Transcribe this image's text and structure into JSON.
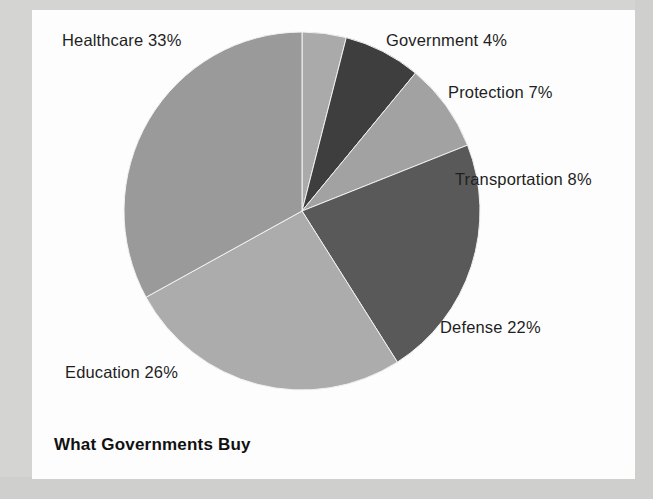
{
  "chart_data": {
    "type": "pie",
    "title": "What Governments Buy",
    "xlabel": "",
    "ylabel": "",
    "legend_position": "none",
    "grid": false,
    "value_unit": "%",
    "categories": [
      "Government",
      "Protection",
      "Transportation",
      "Defense",
      "Education",
      "Healthcare"
    ],
    "values": [
      4,
      7,
      8,
      22,
      26,
      33
    ],
    "labels": [
      "Government 4%",
      "Protection 7%",
      "Transportation 8%",
      "Defense 22%",
      "Education 26%",
      "Healthcare 33%"
    ],
    "slices": [
      {
        "name": "Government",
        "value": 4,
        "label": "Government 4%",
        "color": "#aaaaaa"
      },
      {
        "name": "Protection",
        "value": 7,
        "label": "Protection 7%",
        "color": "#3e3e3e"
      },
      {
        "name": "Transportation",
        "value": 8,
        "label": "Transportation 8%",
        "color": "#a2a2a2"
      },
      {
        "name": "Defense",
        "value": 22,
        "label": "Defense 22%",
        "color": "#595959"
      },
      {
        "name": "Education",
        "value": 26,
        "label": "Education 26%",
        "color": "#acacac"
      },
      {
        "name": "Healthcare",
        "value": 33,
        "label": "Healthcare 33%",
        "color": "#9a9a9a"
      }
    ],
    "start_angle_deg": 0,
    "direction": "clockwise",
    "total": 100
  },
  "labels": {
    "healthcare": "Healthcare 33%",
    "government": "Government 4%",
    "protection": "Protection 7%",
    "transportation": "Transportation 8%",
    "defense": "Defense 22%",
    "education": "Education 26%"
  },
  "title": {
    "text": "What Governments Buy"
  },
  "colors": {
    "page_background": "#d8d8d6",
    "paper": "#fdfdfd",
    "text": "#1f1f1f",
    "title_text": "#111111",
    "healthcare": "#9a9a9a",
    "government": "#aaaaaa",
    "protection": "#3e3e3e",
    "transportation": "#a2a2a2",
    "defense": "#595959",
    "education": "#acacac"
  },
  "geometry": {
    "center_x": 302,
    "center_y": 211,
    "radius_x": 178,
    "radius_y": 179
  }
}
